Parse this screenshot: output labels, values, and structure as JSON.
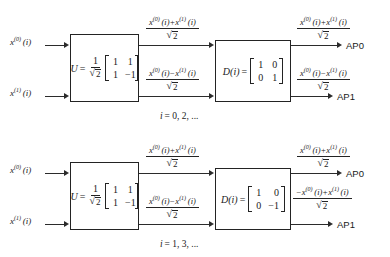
{
  "figure": {
    "kind": "signal-flow-block-diagram",
    "line_color": "#2b2b2b",
    "text_color": "#1a1a1a",
    "background": "#ffffff"
  },
  "diagrams": [
    {
      "id": "top",
      "caption": "i = 0, 2, ...",
      "caption_index_var": "i",
      "caption_values": "= 0, 2, ...",
      "inputs": [
        {
          "base": "x",
          "sup": "(0)",
          "arg": "(i)"
        },
        {
          "base": "x",
          "sup": "(1)",
          "arg": "(i)"
        }
      ],
      "block_u": {
        "lhs": "U",
        "eq": "=",
        "scalar_num": "1",
        "scalar_den_radicand": "2",
        "matrix": [
          [
            "1",
            "1"
          ],
          [
            "1",
            "−1"
          ]
        ]
      },
      "block_d": {
        "lhs": "D(i)",
        "eq": "=",
        "matrix": [
          [
            "1",
            "0"
          ],
          [
            "0",
            "1"
          ]
        ]
      },
      "mid_expressions": [
        {
          "numerator": "x(0)(i) + x(1)(i)",
          "denominator": "√2"
        },
        {
          "numerator": "x(0)(i) − x(1)(i)",
          "denominator": "√2"
        }
      ],
      "out_expressions": [
        {
          "numerator": "x(0)(i) + x(1)(i)",
          "denominator": "√2"
        },
        {
          "numerator": "x(0)(i) − x(1)(i)",
          "denominator": "√2"
        }
      ],
      "outputs": [
        "AP0",
        "AP1"
      ]
    },
    {
      "id": "bottom",
      "caption": "i = 1, 3, ...",
      "caption_index_var": "i",
      "caption_values": "= 1, 3, ...",
      "inputs": [
        {
          "base": "x",
          "sup": "(0)",
          "arg": "(i)"
        },
        {
          "base": "x",
          "sup": "(1)",
          "arg": "(i)"
        }
      ],
      "block_u": {
        "lhs": "U",
        "eq": "=",
        "scalar_num": "1",
        "scalar_den_radicand": "2",
        "matrix": [
          [
            "1",
            "1"
          ],
          [
            "1",
            "−1"
          ]
        ]
      },
      "block_d": {
        "lhs": "D(i)",
        "eq": "=",
        "matrix": [
          [
            "1",
            "0"
          ],
          [
            "0",
            "−1"
          ]
        ]
      },
      "mid_expressions": [
        {
          "numerator": "x(0)(i) + x(1)(i)",
          "denominator": "√2"
        },
        {
          "numerator": "x(0)(i) − x(1)(i)",
          "denominator": "√2"
        }
      ],
      "out_expressions": [
        {
          "numerator": "x(0)(i) + x(1)(i)",
          "denominator": "√2"
        },
        {
          "numerator": "−x(0)(i) + x(1)(i)",
          "denominator": "√2"
        }
      ],
      "outputs": [
        "AP0",
        "AP1"
      ]
    }
  ],
  "symbols": {
    "radical": "√",
    "plus": "+",
    "minus": "−",
    "equals": "=",
    "paren_open": "(",
    "paren_close": ")",
    "sqrt2_radicand": "2",
    "x": "x",
    "i": "i",
    "sup0": "(0)",
    "sup1": "(1)"
  }
}
